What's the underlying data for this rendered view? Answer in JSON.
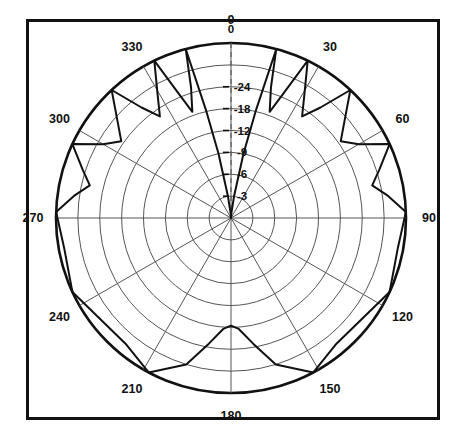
{
  "figure": {
    "kind": "polar-radiation-pattern",
    "border_color": "#111111",
    "grid_color": "#555555",
    "trace_color": "#111111"
  },
  "chart_data": {
    "type": "line",
    "plot_style": "polar",
    "title": "",
    "xlabel": "",
    "ylabel": "",
    "angle_unit": "degrees",
    "angle_direction": "clockwise",
    "angle_zero_at": "top",
    "value_unit": "dB",
    "grid": true,
    "legend": null,
    "angular_ticks": [
      0,
      30,
      60,
      90,
      120,
      150,
      180,
      210,
      240,
      270,
      300,
      330
    ],
    "angular_tick_labels": [
      "0",
      "30",
      "60",
      "90",
      "120",
      "150",
      "180",
      "210",
      "240",
      "270",
      "300",
      "330"
    ],
    "radial_ticks": [
      0,
      -3,
      -6,
      -9,
      -12,
      -18,
      -24
    ],
    "radial_tick_labels": [
      "0",
      "-3",
      "-6",
      "-9",
      "-12",
      "-18",
      "-24"
    ],
    "radial_tick_radius_fraction": [
      0.0,
      0.125,
      0.25,
      0.375,
      0.5,
      0.625,
      0.75
    ],
    "rlim": [
      -40,
      0
    ],
    "ring_count": 8,
    "spoke_count": 12,
    "series": [
      {
        "name": "E-plane pattern",
        "comment": "amplitude in dB vs angle in degrees, clockwise from top",
        "points": [
          {
            "angle": 0,
            "db": 0
          },
          {
            "angle": 4,
            "db": -0.6
          },
          {
            "angle": 8,
            "db": -3.0
          },
          {
            "angle": 11,
            "db": -9.0
          },
          {
            "angle": 13,
            "db": -18.0
          },
          {
            "angle": 15,
            "db": -40.0
          },
          {
            "angle": 17,
            "db": -26.0
          },
          {
            "angle": 20,
            "db": -19.0
          },
          {
            "angle": 23,
            "db": -26.0
          },
          {
            "angle": 26,
            "db": -40.0
          },
          {
            "angle": 31,
            "db": -28.0
          },
          {
            "angle": 35,
            "db": -22.0
          },
          {
            "angle": 39,
            "db": -28.0
          },
          {
            "angle": 43,
            "db": -40.0
          },
          {
            "angle": 50,
            "db": -30.0
          },
          {
            "angle": 55,
            "db": -25.0
          },
          {
            "angle": 60,
            "db": -30.0
          },
          {
            "angle": 65,
            "db": -40.0
          },
          {
            "angle": 72,
            "db": -33.0
          },
          {
            "angle": 77,
            "db": -29.0
          },
          {
            "angle": 82,
            "db": -34.0
          },
          {
            "angle": 88,
            "db": -40.0
          },
          {
            "angle": 100,
            "db": -38.0
          },
          {
            "angle": 115,
            "db": -40.0
          },
          {
            "angle": 140,
            "db": -36.0
          },
          {
            "angle": 152,
            "db": -40.0
          },
          {
            "angle": 163,
            "db": -32.0
          },
          {
            "angle": 170,
            "db": -23.0
          },
          {
            "angle": 176,
            "db": -18.5
          },
          {
            "angle": 180,
            "db": -17.5
          },
          {
            "angle": 184,
            "db": -18.5
          },
          {
            "angle": 190,
            "db": -23.0
          },
          {
            "angle": 197,
            "db": -32.0
          },
          {
            "angle": 208,
            "db": -40.0
          },
          {
            "angle": 220,
            "db": -36.0
          },
          {
            "angle": 245,
            "db": -40.0
          },
          {
            "angle": 260,
            "db": -38.0
          },
          {
            "angle": 272,
            "db": -40.0
          },
          {
            "angle": 278,
            "db": -34.0
          },
          {
            "angle": 283,
            "db": -29.0
          },
          {
            "angle": 288,
            "db": -33.0
          },
          {
            "angle": 295,
            "db": -40.0
          },
          {
            "angle": 300,
            "db": -30.0
          },
          {
            "angle": 305,
            "db": -25.0
          },
          {
            "angle": 310,
            "db": -30.0
          },
          {
            "angle": 317,
            "db": -40.0
          },
          {
            "angle": 321,
            "db": -28.0
          },
          {
            "angle": 325,
            "db": -22.0
          },
          {
            "angle": 329,
            "db": -28.0
          },
          {
            "angle": 334,
            "db": -40.0
          },
          {
            "angle": 337,
            "db": -26.0
          },
          {
            "angle": 340,
            "db": -19.0
          },
          {
            "angle": 343,
            "db": -26.0
          },
          {
            "angle": 345,
            "db": -40.0
          },
          {
            "angle": 347,
            "db": -18.0
          },
          {
            "angle": 349,
            "db": -9.0
          },
          {
            "angle": 352,
            "db": -3.0
          },
          {
            "angle": 356,
            "db": -0.6
          },
          {
            "angle": 360,
            "db": 0
          }
        ]
      }
    ]
  },
  "geometry": {
    "cx": 231,
    "cy": 218,
    "outer_radius": 175,
    "angle_label_radius": 198
  }
}
